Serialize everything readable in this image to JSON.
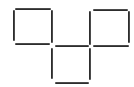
{
  "diagram": {
    "type": "matchstick-puzzle",
    "stick_color": "#1e1e1e",
    "stick_highlight": "#5a5a5a",
    "background": "#ffffff",
    "squares": [
      {
        "name": "top-left-square"
      },
      {
        "name": "top-right-square"
      },
      {
        "name": "bottom-middle-square"
      }
    ],
    "sticks": [
      {
        "name": "top-left-square-top",
        "orient": "h",
        "x": 15,
        "y": 8,
        "len": 36
      },
      {
        "name": "top-left-square-left",
        "orient": "v",
        "x": 13,
        "y": 10,
        "len": 31
      },
      {
        "name": "top-left-square-right",
        "orient": "v",
        "x": 51,
        "y": 10,
        "len": 33
      },
      {
        "name": "top-left-square-bottom",
        "orient": "h",
        "x": 15,
        "y": 43,
        "len": 35
      },
      {
        "name": "top-right-square-top",
        "orient": "h",
        "x": 93,
        "y": 9,
        "len": 35
      },
      {
        "name": "top-right-square-left",
        "orient": "v",
        "x": 89,
        "y": 11,
        "len": 34
      },
      {
        "name": "top-right-square-right",
        "orient": "v",
        "x": 128,
        "y": 11,
        "len": 32
      },
      {
        "name": "top-right-square-bottom",
        "orient": "h",
        "x": 93,
        "y": 45,
        "len": 36
      },
      {
        "name": "bottom-square-top",
        "orient": "h",
        "x": 55,
        "y": 45,
        "len": 34
      },
      {
        "name": "bottom-square-left",
        "orient": "v",
        "x": 51,
        "y": 48,
        "len": 31
      },
      {
        "name": "bottom-square-right",
        "orient": "v",
        "x": 89,
        "y": 48,
        "len": 32
      },
      {
        "name": "bottom-square-bottom",
        "orient": "h",
        "x": 55,
        "y": 82,
        "len": 34
      }
    ],
    "stick_count": 12
  }
}
